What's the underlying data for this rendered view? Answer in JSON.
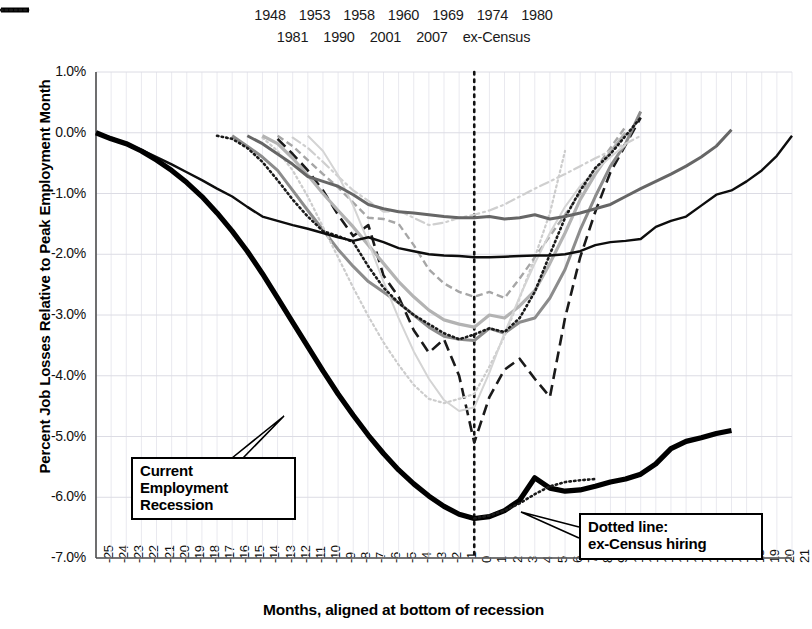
{
  "chart_data": {
    "type": "line",
    "title": "",
    "xlabel": "Months, aligned at bottom of recession",
    "ylabel": "Percent Job Losses Relative to Peak Employment Month",
    "xlim": [
      -25,
      21
    ],
    "ylim": [
      -7.0,
      1.0
    ],
    "grid": true,
    "legend_position": "top",
    "y_ticks": [
      "1.0%",
      "0.0%",
      "-1.0%",
      "-2.0%",
      "-3.0%",
      "-4.0%",
      "-5.0%",
      "-6.0%",
      "-7.0%"
    ],
    "y_tick_values": [
      1.0,
      0.0,
      -1.0,
      -2.0,
      -3.0,
      -4.0,
      -5.0,
      -6.0,
      -7.0
    ],
    "x_ticks": [
      "-25",
      "-24",
      "-23",
      "-22",
      "-21",
      "-20",
      "-19",
      "-18",
      "-17",
      "-16",
      "-15",
      "-14",
      "-13",
      "-12",
      "-11",
      "-10",
      "-9",
      "-8",
      "-7",
      "-6",
      "-5",
      "-4",
      "-3",
      "-2",
      "-1",
      "0",
      "1",
      "2",
      "3",
      "4",
      "5",
      "6",
      "7",
      "8",
      "9",
      "10",
      "11",
      "12",
      "13",
      "14",
      "15",
      "16",
      "17",
      "18",
      "19",
      "20",
      "21"
    ],
    "vertical_marker_x": 0,
    "series": [
      {
        "name": "1948",
        "style": "dashed",
        "color": "#1a1a1a",
        "width": 2.6,
        "x": [
          -13,
          -12,
          -11,
          -10,
          -9,
          -8,
          -7,
          -6,
          -5,
          -4,
          -3,
          -2,
          -1,
          0,
          1,
          2,
          3,
          4,
          5,
          6,
          7,
          8,
          9,
          10,
          11
        ],
        "values": [
          -0.1,
          -0.35,
          -0.62,
          -0.95,
          -1.35,
          -1.7,
          -1.52,
          -2.35,
          -2.7,
          -3.25,
          -3.62,
          -3.4,
          -4.0,
          -5.1,
          -4.35,
          -3.9,
          -3.72,
          -4.05,
          -4.35,
          -3.05,
          -2.05,
          -1.3,
          -0.65,
          -0.2,
          0.25
        ]
      },
      {
        "name": "1953",
        "style": "solid",
        "color": "#8c8c8c",
        "width": 3.0,
        "x": [
          -16,
          -15,
          -14,
          -13,
          -12,
          -11,
          -10,
          -9,
          -8,
          -7,
          -6,
          -5,
          -4,
          -3,
          -2,
          -1,
          0,
          1,
          2,
          3,
          4,
          5,
          6,
          7,
          8,
          9,
          10,
          11
        ],
        "values": [
          -0.05,
          -0.22,
          -0.4,
          -0.62,
          -0.95,
          -1.28,
          -1.6,
          -1.92,
          -2.2,
          -2.45,
          -2.62,
          -2.8,
          -3.0,
          -3.2,
          -3.35,
          -3.4,
          -3.42,
          -3.22,
          -3.3,
          -3.12,
          -3.05,
          -2.72,
          -2.25,
          -1.6,
          -1.05,
          -0.55,
          -0.18,
          0.35
        ]
      },
      {
        "name": "1958",
        "style": "dotted-fine",
        "color": "#cccccc",
        "width": 2.2,
        "x": [
          -14,
          -13,
          -12,
          -11,
          -10,
          -9,
          -8,
          -7,
          -6,
          -5,
          -4,
          -3,
          -2,
          -1,
          0,
          1,
          2,
          3,
          4,
          5,
          6
        ],
        "values": [
          -0.08,
          -0.3,
          -0.62,
          -1.05,
          -1.55,
          -2.05,
          -2.55,
          -3.02,
          -3.45,
          -3.82,
          -4.15,
          -4.38,
          -4.45,
          -4.38,
          -4.3,
          -3.85,
          -3.35,
          -2.72,
          -2.05,
          -1.32,
          -0.3
        ]
      },
      {
        "name": "1960",
        "style": "dashed-fine",
        "color": "#a6a6a6",
        "width": 2.4,
        "x": [
          -13,
          -12,
          -11,
          -10,
          -9,
          -8,
          -7,
          -6,
          -5,
          -4,
          -3,
          -2,
          -1,
          0,
          1,
          2,
          3,
          4,
          5,
          6,
          7,
          8,
          9,
          10
        ],
        "values": [
          -0.05,
          -0.22,
          -0.45,
          -0.68,
          -0.9,
          -1.15,
          -1.4,
          -1.42,
          -1.5,
          -1.85,
          -2.25,
          -2.48,
          -2.62,
          -2.7,
          -2.62,
          -2.72,
          -2.4,
          -2.05,
          -1.7,
          -1.35,
          -1.0,
          -0.6,
          -0.25,
          0.1
        ]
      },
      {
        "name": "1969",
        "style": "dashdot",
        "color": "#cfcfcf",
        "width": 2.2,
        "x": [
          -12,
          -11,
          -10,
          -9,
          -8,
          -7,
          -6,
          -5,
          -4,
          -3,
          -2,
          -1,
          0,
          1,
          2,
          3,
          4,
          5,
          6,
          7,
          8,
          9,
          10,
          11
        ],
        "values": [
          -0.08,
          -0.25,
          -0.48,
          -0.72,
          -0.95,
          -1.12,
          -1.3,
          -1.28,
          -1.4,
          -1.52,
          -1.48,
          -1.4,
          -1.35,
          -1.28,
          -1.18,
          -1.05,
          -0.92,
          -0.8,
          -0.68,
          -0.55,
          -0.42,
          -0.3,
          -0.18,
          -0.05
        ]
      },
      {
        "name": "1974",
        "style": "solid",
        "color": "#b3b3b3",
        "width": 3.2,
        "x": [
          -14,
          -13,
          -12,
          -11,
          -10,
          -9,
          -8,
          -7,
          -6,
          -5,
          -4,
          -3,
          -2,
          -1,
          0,
          1,
          2,
          3,
          4,
          5,
          6,
          7,
          8,
          9,
          10
        ],
        "values": [
          -0.05,
          -0.18,
          -0.42,
          -0.7,
          -1.0,
          -1.28,
          -1.55,
          -1.85,
          -2.15,
          -2.45,
          -2.7,
          -2.92,
          -3.08,
          -3.15,
          -3.2,
          -3.0,
          -3.05,
          -2.85,
          -2.6,
          -2.15,
          -1.65,
          -1.1,
          -0.68,
          -0.32,
          0.0
        ]
      },
      {
        "name": "1980",
        "style": "solid",
        "color": "#d4d4d4",
        "width": 2.0,
        "x": [
          -11,
          -10,
          -9,
          -8,
          -7,
          -6,
          -5,
          -4,
          -3,
          -2,
          -1,
          0,
          1,
          2,
          3,
          4,
          5,
          6,
          7,
          8,
          9,
          10
        ],
        "values": [
          -0.05,
          -0.3,
          -0.7,
          -1.2,
          -1.8,
          -2.45,
          -3.05,
          -3.6,
          -4.05,
          -4.4,
          -4.58,
          -4.52,
          -3.95,
          -3.3,
          -2.7,
          -2.15,
          -1.65,
          -1.22,
          -0.88,
          -0.62,
          -0.4,
          -0.2
        ]
      },
      {
        "name": "1981",
        "style": "dotted",
        "color": "#1a1a1a",
        "width": 2.6,
        "x": [
          -17,
          -16,
          -15,
          -14,
          -13,
          -12,
          -11,
          -10,
          -9,
          -8,
          -7,
          -6,
          -5,
          -4,
          -3,
          -2,
          -1,
          0,
          1,
          2,
          3,
          4,
          5,
          6,
          7,
          8,
          9,
          10,
          11
        ],
        "values": [
          -0.05,
          -0.1,
          -0.25,
          -0.48,
          -0.78,
          -1.1,
          -1.38,
          -1.62,
          -1.7,
          -1.8,
          -2.2,
          -2.55,
          -2.8,
          -3.0,
          -3.15,
          -3.3,
          -3.4,
          -3.32,
          -3.22,
          -3.28,
          -3.05,
          -2.62,
          -2.0,
          -1.4,
          -0.95,
          -0.58,
          -0.35,
          -0.05,
          0.25
        ]
      },
      {
        "name": "1990",
        "style": "solid",
        "color": "#666666",
        "width": 3.0,
        "x": [
          -15,
          -14,
          -13,
          -12,
          -11,
          -10,
          -9,
          -8,
          -7,
          -6,
          -5,
          -4,
          -3,
          -2,
          -1,
          0,
          1,
          2,
          3,
          4,
          5,
          6,
          7,
          8,
          9,
          10,
          11,
          12,
          13,
          14,
          15,
          16,
          17
        ],
        "values": [
          -0.05,
          -0.18,
          -0.35,
          -0.52,
          -0.72,
          -0.8,
          -0.88,
          -1.02,
          -1.18,
          -1.25,
          -1.3,
          -1.32,
          -1.35,
          -1.38,
          -1.4,
          -1.4,
          -1.38,
          -1.42,
          -1.4,
          -1.35,
          -1.42,
          -1.38,
          -1.32,
          -1.25,
          -1.18,
          -1.05,
          -0.92,
          -0.8,
          -0.68,
          -0.55,
          -0.4,
          -0.22,
          0.05
        ]
      },
      {
        "name": "2001",
        "style": "solid",
        "color": "#0d0d0d",
        "width": 2.4,
        "x": [
          -25,
          -24,
          -23,
          -22,
          -21,
          -20,
          -19,
          -18,
          -17,
          -16,
          -15,
          -14,
          -13,
          -12,
          -11,
          -10,
          -9,
          -8,
          -7,
          -6,
          -5,
          -4,
          -3,
          -2,
          -1,
          0,
          1,
          2,
          3,
          4,
          5,
          6,
          7,
          8,
          9,
          10,
          11,
          12,
          13,
          14,
          15,
          16,
          17,
          18,
          19,
          20,
          21
        ],
        "values": [
          0.0,
          -0.08,
          -0.18,
          -0.28,
          -0.4,
          -0.52,
          -0.65,
          -0.78,
          -0.92,
          -1.05,
          -1.22,
          -1.38,
          -1.45,
          -1.52,
          -1.58,
          -1.65,
          -1.72,
          -1.78,
          -1.72,
          -1.8,
          -1.9,
          -1.95,
          -2.0,
          -2.02,
          -2.03,
          -2.05,
          -2.05,
          -2.04,
          -2.03,
          -2.02,
          -2.02,
          -2.0,
          -1.95,
          -1.85,
          -1.8,
          -1.78,
          -1.75,
          -1.55,
          -1.45,
          -1.38,
          -1.2,
          -1.02,
          -0.95,
          -0.8,
          -0.62,
          -0.38,
          -0.05
        ]
      },
      {
        "name": "2007",
        "style": "solid",
        "color": "#000000",
        "width": 5.2,
        "x": [
          -25,
          -24,
          -23,
          -22,
          -21,
          -20,
          -19,
          -18,
          -17,
          -16,
          -15,
          -14,
          -13,
          -12,
          -11,
          -10,
          -9,
          -8,
          -7,
          -6,
          -5,
          -4,
          -3,
          -2,
          -1,
          0,
          1,
          2,
          3,
          4,
          5,
          6,
          7,
          8,
          9,
          10,
          11,
          12,
          13,
          14,
          15,
          16,
          17
        ],
        "values": [
          0.0,
          -0.1,
          -0.18,
          -0.3,
          -0.45,
          -0.62,
          -0.82,
          -1.05,
          -1.32,
          -1.62,
          -1.95,
          -2.32,
          -2.72,
          -3.12,
          -3.52,
          -3.92,
          -4.3,
          -4.65,
          -4.98,
          -5.28,
          -5.55,
          -5.78,
          -5.98,
          -6.15,
          -6.28,
          -6.35,
          -6.32,
          -6.22,
          -6.05,
          -5.68,
          -5.85,
          -5.9,
          -5.88,
          -5.82,
          -5.75,
          -5.7,
          -5.62,
          -5.45,
          -5.2,
          -5.08,
          -5.02,
          -4.95,
          -4.9
        ]
      },
      {
        "name": "ex-Census",
        "style": "dotted",
        "color": "#1a1a1a",
        "width": 2.6,
        "x": [
          0,
          1,
          2,
          3,
          4,
          5,
          6,
          7,
          8
        ],
        "values": [
          -6.35,
          -6.3,
          -6.22,
          -6.1,
          -5.95,
          -5.82,
          -5.75,
          -5.72,
          -5.7
        ]
      }
    ]
  },
  "legend": {
    "row1": [
      {
        "label": "1948"
      },
      {
        "label": "1953"
      },
      {
        "label": "1958"
      },
      {
        "label": "1960"
      },
      {
        "label": "1969"
      },
      {
        "label": "1974"
      },
      {
        "label": "1980"
      }
    ],
    "row2": [
      {
        "label": "1981"
      },
      {
        "label": "1990"
      },
      {
        "label": "2001"
      },
      {
        "label": "2007"
      },
      {
        "label": "ex-Census"
      }
    ]
  },
  "annotations": {
    "current_recession": {
      "line1": "Current",
      "line2": "Employment",
      "line3": "Recession"
    },
    "ex_census": {
      "line1": "Dotted line:",
      "line2": "ex-Census hiring"
    }
  }
}
